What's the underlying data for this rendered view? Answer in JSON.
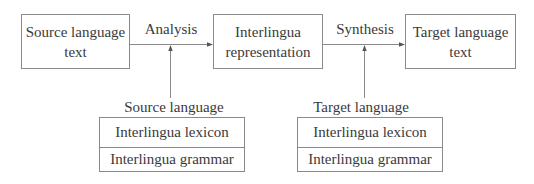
{
  "diagram": {
    "type": "flow",
    "nodes": {
      "source_text": {
        "line1": "Source language",
        "line2": "text"
      },
      "interlingua": {
        "line1": "Interlingua",
        "line2": "representation"
      },
      "target_text": {
        "line1": "Target language",
        "line2": "text"
      }
    },
    "edges": {
      "analysis": {
        "label": "Analysis",
        "from": "Source language text",
        "to": "Interlingua representation"
      },
      "synthesis": {
        "label": "Synthesis",
        "from": "Interlingua representation",
        "to": "Target language text"
      }
    },
    "resources": {
      "source": {
        "label": "Source language",
        "lexicon": "Interlingua lexicon",
        "grammar": "Interlingua grammar",
        "feeds": "Analysis"
      },
      "target": {
        "label": "Target language",
        "lexicon": "Interlingua lexicon",
        "grammar": "Interlingua grammar",
        "feeds": "Synthesis"
      }
    },
    "colors": {
      "line": "#8a8a8a",
      "arrow": "#555555",
      "text": "#3a3a3a",
      "background": "#ffffff"
    }
  }
}
